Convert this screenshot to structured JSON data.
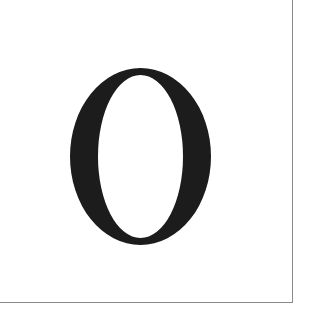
{
  "tile": {
    "character": "O",
    "glyph_color": "#1c1c1c",
    "border_color": "#8a8a8a",
    "background_color": "#ffffff"
  }
}
